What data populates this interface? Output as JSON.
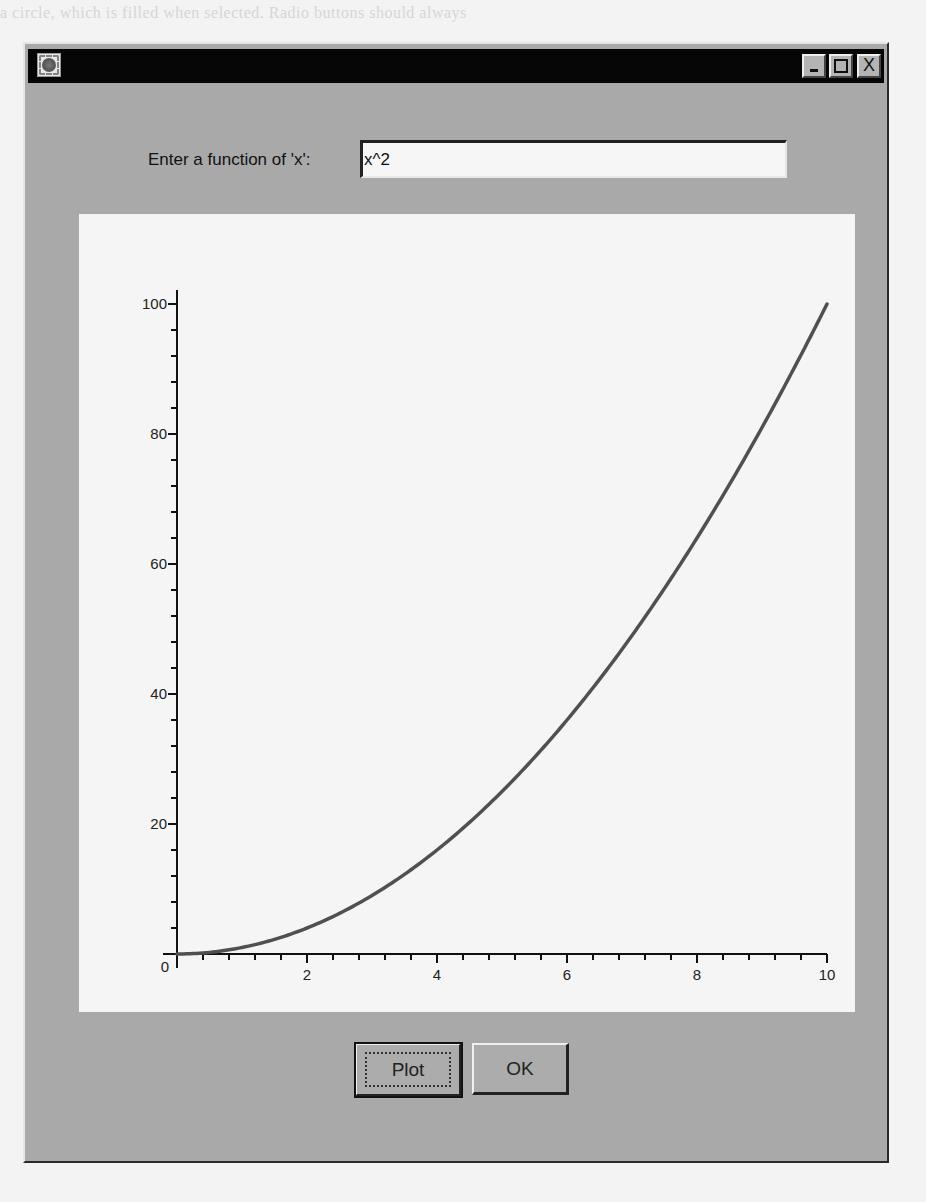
{
  "background": {
    "ghost_text": "a circle, which is filled when selected. Radio buttons should always"
  },
  "window": {
    "title": "",
    "controls": {
      "minimize": "_",
      "maximize": "□",
      "close": "X"
    }
  },
  "form": {
    "label": "Enter a function of 'x':",
    "function_value": "x^2",
    "function_placeholder": ""
  },
  "buttons": {
    "plot": "Plot",
    "ok": "OK"
  },
  "colors": {
    "window_bg": "#a9a9a9",
    "titlebar": "#060606",
    "plot_bg": "#f5f5f5",
    "curve": "#505050",
    "axis": "#111111"
  },
  "chart_data": {
    "type": "line",
    "title": "",
    "function": "x^2",
    "xlabel": "x",
    "ylabel": "",
    "xlim": [
      0,
      10
    ],
    "ylim": [
      0,
      100
    ],
    "x_ticks": [
      0,
      2,
      4,
      6,
      8,
      10
    ],
    "x_tick_labels": [
      "2",
      "4",
      "6",
      "8",
      "10"
    ],
    "y_ticks": [
      0,
      20,
      40,
      60,
      80,
      100
    ],
    "y_tick_labels": [
      "0",
      "20",
      "40",
      "60",
      "80",
      "100"
    ],
    "x_minor_step": 0.4,
    "y_minor_step": 4,
    "grid": false,
    "legend": null,
    "series": [
      {
        "name": "x^2",
        "x": [
          0,
          1,
          2,
          3,
          4,
          5,
          6,
          7,
          8,
          9,
          10
        ],
        "values": [
          0,
          1,
          4,
          9,
          16,
          25,
          36,
          49,
          64,
          81,
          100
        ]
      }
    ]
  }
}
